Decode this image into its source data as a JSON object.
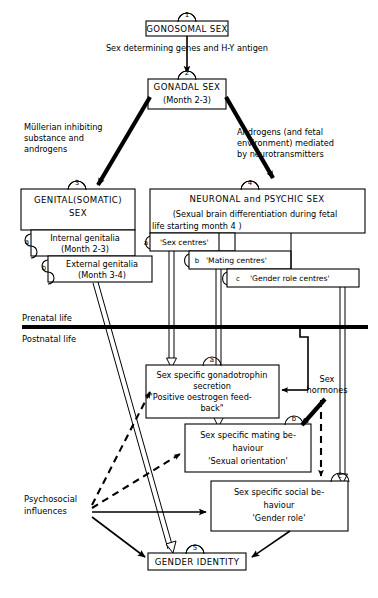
{
  "diagram": {
    "title_nodes": [
      {
        "id": "1",
        "label": "GONOSOMAL SEX",
        "sub": ""
      },
      {
        "id": "2",
        "label": "GONADAL SEX",
        "sub": "(Month 2-3)"
      },
      {
        "id": "3",
        "label": "GENITAL(SOMATIC)",
        "label2": "SEX",
        "sub": ""
      },
      {
        "id": "4",
        "label": "NEURONAL and PSYCHIC SEX",
        "sub1": "(Sexual brain differentiation during fetal",
        "sub2": "life starting month 4 )"
      },
      {
        "id": "5",
        "label": "GENDER IDENTITY",
        "sub": ""
      }
    ],
    "edge_labels": {
      "gonosomal_to_gonadal": "Sex determining genes and H-Y antigen",
      "mullerian_line1": "Müllerian inhibiting",
      "mullerian_line2": "substance and",
      "mullerian_line3": "androgens",
      "androgens_line1": "Androgens  (and fetal",
      "androgens_line2": "environment) mediated",
      "androgens_line3": "by neurotransmitters",
      "sex_hormones_line1": "Sex",
      "sex_hormones_line2": "hormones",
      "psychosocial_line1": "Psychosocial",
      "psychosocial_line2": "influences"
    },
    "timeline": {
      "prenatal": "Prenatal life",
      "postnatal": "Postnatal life"
    },
    "genital_substeps": [
      {
        "tag": "a",
        "line1": "Internal genitalia",
        "line2": "(Month 2-3)"
      },
      {
        "tag": "b",
        "line1": "External genitalia",
        "line2": "(Month 3-4)"
      }
    ],
    "brain_centres": [
      {
        "tag": "a",
        "label": "'Sex centres'"
      },
      {
        "tag": "b",
        "label": "'Mating centres'"
      },
      {
        "tag": "c",
        "label": "'Gender role centres'"
      }
    ],
    "outcome_boxes": [
      {
        "tag": "a",
        "line1": "Sex specific gonadotrophin",
        "line2": "secretion",
        "line3": "\"Positive oestrogen feed-",
        "line4": "back\""
      },
      {
        "tag": "b",
        "line1": "Sex specific mating be-",
        "line2": "haviour",
        "line3": "'Sexual orientation'",
        "line4": ""
      },
      {
        "tag": "c",
        "line1": "Sex specific social  be-",
        "line2": "haviour",
        "line3": "'Gender role'",
        "line4": ""
      }
    ],
    "colors": {
      "ink": "#000000",
      "paper": "#ffffff"
    }
  }
}
